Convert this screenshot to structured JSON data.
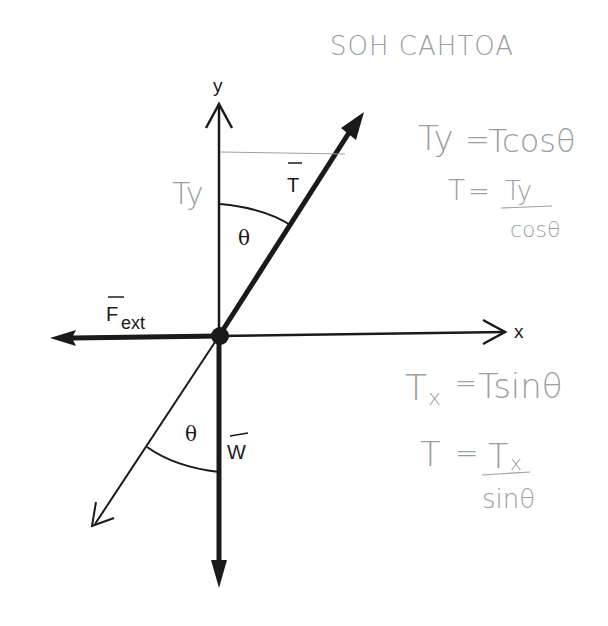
{
  "diagram": {
    "title_note": "SOH CAHTOA",
    "axes": {
      "x_label": "x",
      "y_label": "y"
    },
    "vectors": {
      "tension": {
        "label": "T",
        "arrow": true
      },
      "external_force": {
        "label": "F",
        "subscript": "ext",
        "arrow": true
      },
      "weight": {
        "label": "W",
        "arrow": true
      }
    },
    "angles": {
      "upper": "θ",
      "lower": "θ"
    },
    "component_label": "Ty",
    "equations": {
      "ty_eq": {
        "lhs": "Ty",
        "eq": "=",
        "rhs": "Tcosθ"
      },
      "t_from_ty": {
        "lhs": "T",
        "eq": "=",
        "num": "Ty",
        "den": "cosθ"
      },
      "tx_eq": {
        "lhs": "T",
        "lhs_sub": "x",
        "eq": "=",
        "rhs": "Tsinθ"
      },
      "t_from_tx": {
        "lhs": "T",
        "eq": "=",
        "num": "T",
        "num_sub": "x",
        "den": "sinθ"
      }
    },
    "colors": {
      "ink": "#1a1a1a",
      "pencil": "#9aa0a0",
      "background": "#ffffff"
    }
  }
}
